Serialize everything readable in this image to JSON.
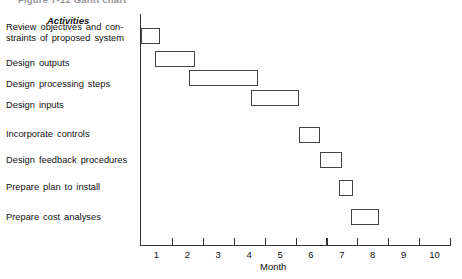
{
  "figure": {
    "title": "Figure 7-12   Gantt chart"
  },
  "axis": {
    "column_header": "Activities",
    "x_title": "Month",
    "x_ticks": [
      1,
      2,
      3,
      4,
      5,
      6,
      7,
      8,
      9,
      10
    ]
  },
  "chart_data": {
    "type": "bar",
    "title": "Figure 7-12   Gantt chart",
    "xlabel": "Month",
    "ylabel": "Activities",
    "xlim": [
      0,
      10
    ],
    "grid": false,
    "legend": "none",
    "orientation": "horizontal-gantt",
    "categories": [
      "Review objectives and con-straints of proposed system",
      "Design outputs",
      "Design processing steps",
      "Design inputs",
      "Incorporate controls",
      "Design feedback procedures",
      "Prepare plan to install",
      "Prepare cost analyses"
    ],
    "tasks": [
      {
        "label": "Review objectives and con-straints of proposed system",
        "start": 0.0,
        "end": 0.6
      },
      {
        "label": "Design outputs",
        "start": 0.45,
        "end": 1.75
      },
      {
        "label": "Design processing steps",
        "start": 1.55,
        "end": 3.8
      },
      {
        "label": "Design inputs",
        "start": 3.55,
        "end": 5.1
      },
      {
        "label": "Incorporate controls",
        "start": 5.1,
        "end": 5.8
      },
      {
        "label": "Design feedback procedures",
        "start": 5.8,
        "end": 6.5
      },
      {
        "label": "Prepare plan to install",
        "start": 6.4,
        "end": 6.85
      },
      {
        "label": "Prepare cost analyses",
        "start": 6.8,
        "end": 7.7
      }
    ]
  },
  "activities": [
    {
      "line1": "Review objectives and con-",
      "line2": "straints of proposed system"
    },
    {
      "line1": "Design outputs",
      "line2": ""
    },
    {
      "line1": "Design processing steps",
      "line2": ""
    },
    {
      "line1": "Design inputs",
      "line2": ""
    },
    {
      "line1": "Incorporate controls",
      "line2": ""
    },
    {
      "line1": "Design feedback procedures",
      "line2": ""
    },
    {
      "line1": "Prepare plan to install",
      "line2": ""
    },
    {
      "line1": "Prepare cost analyses",
      "line2": ""
    }
  ],
  "colors": {
    "bar_border": "#444444",
    "bar_fill": "#ffffff",
    "axis": "#333333",
    "text": "#111111",
    "background": "#ffffff"
  }
}
